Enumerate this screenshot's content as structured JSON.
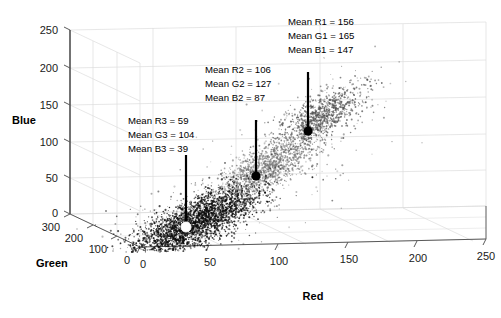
{
  "chart_data": {
    "type": "scatter",
    "title": "",
    "xlabel": "Red",
    "ylabel": "Green",
    "zlabel": "Blue",
    "xlim": [
      0,
      250
    ],
    "ylim": [
      0,
      300
    ],
    "zlim": [
      0,
      250
    ],
    "xticks": [
      0,
      50,
      100,
      150,
      200,
      250
    ],
    "yticks": [
      0,
      100,
      200,
      300
    ],
    "zticks": [
      0,
      50,
      100,
      150,
      200,
      250
    ],
    "grid": true,
    "legend": "none",
    "projection": "3d",
    "clusters": [
      {
        "id": 1,
        "name": "cluster-1",
        "mean_red": 156,
        "mean_green": 165,
        "mean_blue": 147,
        "color": "#555555",
        "marker_color": "#000000",
        "n_points": 900,
        "spread": "diffuse"
      },
      {
        "id": 2,
        "name": "cluster-2",
        "mean_red": 106,
        "mean_green": 127,
        "mean_blue": 87,
        "color": "#7d7d7d",
        "marker_color": "#000000",
        "n_points": 1100,
        "spread": "medium"
      },
      {
        "id": 3,
        "name": "cluster-3",
        "mean_red": 59,
        "mean_green": 104,
        "mean_blue": 39,
        "color": "#111111",
        "marker_color": "#ffffff",
        "n_points": 2600,
        "spread": "dense"
      }
    ],
    "annotations": [
      {
        "id": "annotation-1",
        "lines": [
          "Mean R1 = 156",
          "Mean G1 = 165",
          "Mean B1 = 147"
        ],
        "points_to_cluster": 1
      },
      {
        "id": "annotation-2",
        "lines": [
          "Mean R2 = 106",
          "Mean G2 = 127",
          "Mean B2 = 87"
        ],
        "points_to_cluster": 2
      },
      {
        "id": "annotation-3",
        "lines": [
          "Mean R3 = 59",
          "Mean G3 = 104",
          "Mean B3 = 39"
        ],
        "points_to_cluster": 3
      }
    ]
  },
  "axes": {
    "red": {
      "label": "Red",
      "ticks": [
        "0",
        "50",
        "100",
        "150",
        "200",
        "250"
      ]
    },
    "green": {
      "label": "Green",
      "ticks": [
        "0",
        "100",
        "200",
        "300"
      ]
    },
    "blue": {
      "label": "Blue",
      "ticks": [
        "0",
        "50",
        "100",
        "150",
        "200",
        "250"
      ]
    }
  },
  "annotation_text": {
    "a1_l1": "Mean R1 = 156",
    "a1_l2": "Mean G1 = 165",
    "a1_l3": "Mean B1 = 147",
    "a2_l1": "Mean R2 = 106",
    "a2_l2": "Mean G2 = 127",
    "a2_l3": "Mean B2 = 87",
    "a3_l1": "Mean R3 = 59",
    "a3_l2": "Mean G3 = 104",
    "a3_l3": "Mean B3 = 39"
  },
  "colors": {
    "background": "#ffffff",
    "grid": "#d2d2d2",
    "axis": "#5a5a5a",
    "text": "#000000",
    "cluster_dark": "#111111",
    "cluster_mid": "#7d7d7d",
    "cluster_light": "#555555",
    "marker_white": "#ffffff",
    "marker_black": "#000000"
  }
}
